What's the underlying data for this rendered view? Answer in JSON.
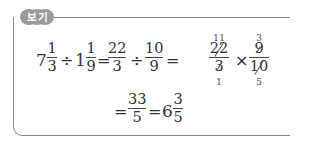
{
  "example_box": {
    "label": "보기",
    "line1": {
      "mixed1": {
        "whole": "7",
        "num": "1",
        "den": "3"
      },
      "div1": "÷",
      "mixed2": {
        "whole": "1",
        "num": "1",
        "den": "9"
      },
      "eq1": "=",
      "frac1": {
        "num": "22",
        "den": "3"
      },
      "div2": "÷",
      "frac2": {
        "num": "10",
        "den": "9"
      },
      "eq2": "=",
      "frac3": {
        "num": "22",
        "den": "3",
        "num_reduced": "11",
        "den_reduced": "1"
      },
      "times": "×",
      "frac4": {
        "num": "9",
        "den": "10",
        "num_reduced": "3",
        "den_reduced": "5"
      }
    },
    "line2": {
      "eq1": "=",
      "frac": {
        "num": "33",
        "den": "5"
      },
      "eq2": "=",
      "result": {
        "whole": "6",
        "num": "3",
        "den": "5"
      }
    }
  },
  "colors": {
    "border": "#8a8a8a",
    "label_bg": "#9a9a9a",
    "text": "#333333"
  }
}
